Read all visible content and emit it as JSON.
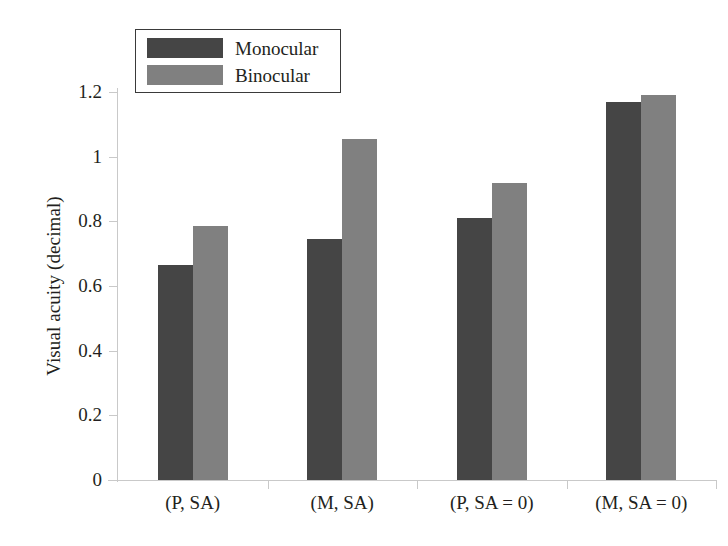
{
  "chart_data": {
    "type": "bar",
    "title": "",
    "xlabel": "",
    "ylabel": "Visual acuity (decimal)",
    "categories": [
      "(P, SA)",
      "(M, SA)",
      "(P, SA = 0)",
      "(M, SA = 0)"
    ],
    "series": [
      {
        "name": "Monocular",
        "color": "#454545",
        "values": [
          0.665,
          0.745,
          0.81,
          1.17
        ]
      },
      {
        "name": "Binocular",
        "color": "#808080",
        "values": [
          0.785,
          1.055,
          0.92,
          1.19
        ]
      }
    ],
    "ylim": [
      0,
      1.2
    ],
    "yticks": [
      0,
      0.2,
      0.4,
      0.6,
      0.8,
      1,
      1.2
    ],
    "ytick_labels": [
      "0",
      "0.2",
      "0.4",
      "0.6",
      "0.8",
      "1",
      "1.2"
    ],
    "grid": false,
    "legend_position": "top-left"
  }
}
